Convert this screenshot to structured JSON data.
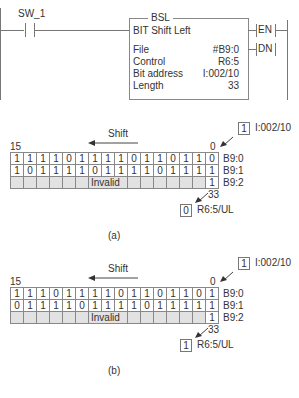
{
  "ladder": {
    "contact_label": "SW_1",
    "instruction": {
      "mnemonic": "BSL",
      "title": "BIT Shift Left",
      "params": [
        {
          "name": "File",
          "value": "#B9:0"
        },
        {
          "name": "Control",
          "value": "R6:5"
        },
        {
          "name": "Bit address",
          "value": "I:002/10"
        },
        {
          "name": "Length",
          "value": "33"
        }
      ]
    },
    "outputs": [
      "EN",
      "DN"
    ]
  },
  "panels": [
    {
      "caption": "(a)",
      "shift_label": "Shift",
      "msb_label": "15",
      "lsb_label": "0",
      "input_bit": {
        "value": "1",
        "address": "I:002/10"
      },
      "rows": [
        {
          "label": "B9:0",
          "bits": [
            "1",
            "1",
            "1",
            "1",
            "0",
            "1",
            "1",
            "1",
            "1",
            "0",
            "1",
            "1",
            "0",
            "1",
            "1",
            "0"
          ]
        },
        {
          "label": "B9:1",
          "bits": [
            "1",
            "0",
            "1",
            "1",
            "1",
            "1",
            "0",
            "1",
            "1",
            "1",
            "1",
            "0",
            "1",
            "1",
            "1",
            "1"
          ]
        },
        {
          "label": "B9:2",
          "invalid_text": "Invalid",
          "bit0": "1"
        }
      ],
      "length_label": "33",
      "unload_bit": {
        "value": "0",
        "address": "R6:5/UL"
      }
    },
    {
      "caption": "(b)",
      "shift_label": "Shift",
      "msb_label": "15",
      "lsb_label": "0",
      "input_bit": {
        "value": "1",
        "address": "I:002/10"
      },
      "rows": [
        {
          "label": "B9:0",
          "bits": [
            "1",
            "1",
            "1",
            "0",
            "1",
            "1",
            "1",
            "1",
            "0",
            "1",
            "1",
            "0",
            "1",
            "1",
            "0",
            "1"
          ]
        },
        {
          "label": "B9:1",
          "bits": [
            "0",
            "1",
            "1",
            "1",
            "1",
            "0",
            "1",
            "1",
            "1",
            "1",
            "0",
            "1",
            "1",
            "1",
            "1",
            "1"
          ]
        },
        {
          "label": "B9:2",
          "invalid_text": "Invalid",
          "bit0": "1"
        }
      ],
      "length_label": "33",
      "unload_bit": {
        "value": "1",
        "address": "R6:5/UL"
      }
    }
  ]
}
